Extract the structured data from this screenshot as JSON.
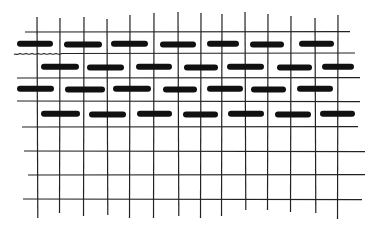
{
  "figure": {
    "title": "",
    "colors": {
      "background": "#ffffff",
      "ink": "#111111",
      "grid": "#222222"
    }
  },
  "grid": {
    "horizontal_lines": [
      {
        "y": 32,
        "x1": 25,
        "x2": 350
      },
      {
        "y": 53,
        "x1": 14,
        "x2": 355,
        "wavy_left": true
      },
      {
        "y": 78,
        "x1": 17,
        "x2": 360
      },
      {
        "y": 101,
        "x1": 17,
        "x2": 360
      },
      {
        "y": 127,
        "x1": 22,
        "x2": 358
      },
      {
        "y": 151,
        "x1": 24,
        "x2": 365
      },
      {
        "y": 175,
        "x1": 28,
        "x2": 365
      },
      {
        "y": 199,
        "x1": 23,
        "x2": 362
      }
    ],
    "vertical_lines": [
      {
        "x": 37,
        "y1": 17,
        "y2": 218
      },
      {
        "x": 60,
        "y1": 18,
        "y2": 213
      },
      {
        "x": 84,
        "y1": 17,
        "y2": 216
      },
      {
        "x": 107,
        "y1": 19,
        "y2": 215
      },
      {
        "x": 130,
        "y1": 15,
        "y2": 218
      },
      {
        "x": 154,
        "y1": 13,
        "y2": 218
      },
      {
        "x": 178,
        "y1": 12,
        "y2": 216
      },
      {
        "x": 201,
        "y1": 13,
        "y2": 218
      },
      {
        "x": 222,
        "y1": 14,
        "y2": 216
      },
      {
        "x": 245,
        "y1": 12,
        "y2": 210
      },
      {
        "x": 268,
        "y1": 14,
        "y2": 210
      },
      {
        "x": 291,
        "y1": 16,
        "y2": 212
      },
      {
        "x": 315,
        "y1": 18,
        "y2": 213
      },
      {
        "x": 338,
        "y1": 15,
        "y2": 219
      }
    ]
  },
  "dashes": [
    {
      "row": 1,
      "y": 44,
      "segments": [
        [
          17,
          53
        ],
        [
          64,
          102
        ],
        [
          111,
          148
        ],
        [
          160,
          196
        ],
        [
          207,
          239
        ],
        [
          250,
          284
        ],
        [
          299,
          334
        ]
      ]
    },
    {
      "row": 2,
      "y": 67,
      "segments": [
        [
          41,
          79
        ],
        [
          87,
          124
        ],
        [
          136,
          172
        ],
        [
          184,
          218
        ],
        [
          227,
          264
        ],
        [
          277,
          312
        ],
        [
          322,
          354
        ]
      ]
    },
    {
      "row": 3,
      "y": 89,
      "segments": [
        [
          17,
          54
        ],
        [
          65,
          105
        ],
        [
          113,
          151
        ],
        [
          163,
          197
        ],
        [
          207,
          243
        ],
        [
          251,
          286
        ],
        [
          297,
          333
        ]
      ]
    },
    {
      "row": 4,
      "y": 114,
      "segments": [
        [
          41,
          80
        ],
        [
          89,
          126
        ],
        [
          137,
          172
        ],
        [
          183,
          218
        ],
        [
          228,
          264
        ],
        [
          275,
          311
        ],
        [
          320,
          355
        ]
      ]
    }
  ]
}
